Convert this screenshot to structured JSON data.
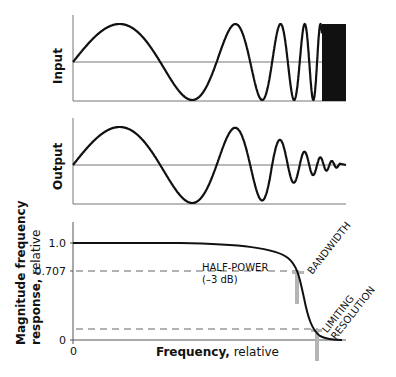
{
  "panels": {
    "input": {
      "label": "Input"
    },
    "output": {
      "label": "Output"
    }
  },
  "response_chart": {
    "ylabel_bold": "Magnitude frequency",
    "ylabel_line2_bold": "response,",
    "ylabel_line2_light": " relative",
    "xlabel_bold": "Frequency,",
    "xlabel_light": " relative",
    "y_ticks": [
      "1.0",
      "0.707",
      "0"
    ],
    "x_ticks": [
      "0"
    ],
    "annotations": {
      "half_power_line1": "HALF-POWER",
      "half_power_line2": "(–3 dB)",
      "bandwidth": "BANDWIDTH",
      "limiting_line1": "LIMITING",
      "limiting_line2": "RESOLUTION"
    }
  },
  "chart_data": {
    "type": "line",
    "title": "",
    "xlabel": "Frequency, relative",
    "ylabel": "Magnitude frequency response, relative",
    "ylim": [
      0,
      1.0
    ],
    "y_ticks": [
      0,
      0.707,
      1.0
    ],
    "x_ticks": [
      0
    ],
    "series": [
      {
        "name": "Magnitude frequency response",
        "description": "flat near 1.0 then rolls off steeply to ~0"
      }
    ],
    "reference_lines": [
      {
        "y": 0.707,
        "label": "HALF-POWER (–3 dB)",
        "style": "dashed"
      },
      {
        "y": 0.1,
        "label": "",
        "style": "dashed"
      }
    ],
    "markers": [
      {
        "label": "BANDWIDTH",
        "at": "half-power crossing"
      },
      {
        "label": "LIMITING RESOLUTION",
        "at": "low-response crossing"
      }
    ],
    "colors": {
      "curve": "#111111",
      "marker": "#b5b5b5",
      "axes": "#555555"
    }
  }
}
